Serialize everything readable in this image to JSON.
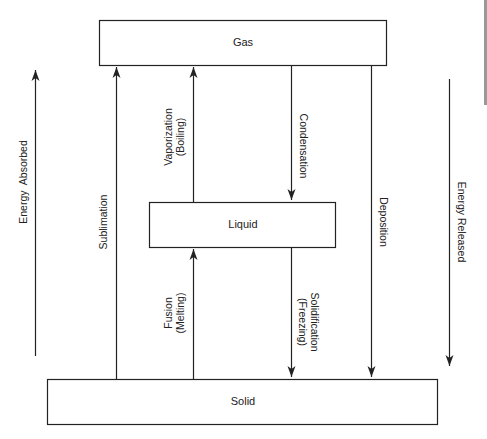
{
  "diagram": {
    "type": "phase-change-diagram",
    "states": {
      "gas": {
        "label": "Gas"
      },
      "liquid": {
        "label": "Liquid"
      },
      "solid": {
        "label": "Solid"
      }
    },
    "transitions": {
      "sublimation": {
        "label": "Sublimation",
        "from": "Solid",
        "to": "Gas"
      },
      "vaporization": {
        "label_line1": "Vaporization",
        "label_line2": "(Boiling)",
        "from": "Liquid",
        "to": "Gas"
      },
      "condensation": {
        "label": "Condensation",
        "from": "Gas",
        "to": "Liquid"
      },
      "deposition": {
        "label": "Deposition",
        "from": "Gas",
        "to": "Solid"
      },
      "fusion": {
        "label_line1": "Fusion",
        "label_line2": "(Melting)",
        "from": "Solid",
        "to": "Liquid"
      },
      "solidification": {
        "label_line1": "Solidification",
        "label_line2": "(Freezing)",
        "from": "Liquid",
        "to": "Solid"
      }
    },
    "energy": {
      "absorbed": {
        "label": "Energy  Absorbed",
        "direction": "up"
      },
      "released": {
        "label": "Energy Released",
        "direction": "down"
      }
    },
    "colors": {
      "stroke": "#222222",
      "background": "#ffffff",
      "side_bar": "#999999"
    }
  }
}
